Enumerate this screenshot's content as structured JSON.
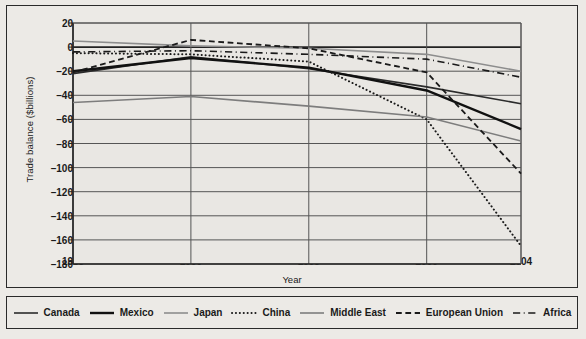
{
  "chart_data": {
    "type": "line",
    "title": "",
    "xlabel": "Year",
    "ylabel": "Trade balance ($billions)",
    "x": [
      1985,
      1990,
      1995,
      2000,
      2004
    ],
    "xticklabels": [
      "1985",
      "1990",
      "1995",
      "2000",
      "2004"
    ],
    "yticklabels": [
      "20",
      "0",
      "-20",
      "-40",
      "-60",
      "-80",
      "-100",
      "-120",
      "-140",
      "-160",
      "-180"
    ],
    "xlim": [
      1985,
      2004
    ],
    "ylim": [
      -180,
      20
    ],
    "ytick_step": 20,
    "grid": "horizontal-and-vertical",
    "legend_position": "below-chart",
    "series": [
      {
        "name": "Canada",
        "style": "solid",
        "color": "#2b2b2b",
        "width": 1.6,
        "values": [
          -22,
          -8,
          -18,
          -33,
          -47
        ]
      },
      {
        "name": "Mexico",
        "style": "solid",
        "color": "#111111",
        "width": 2.4,
        "values": [
          -20,
          -9,
          -17,
          -36,
          -68
        ]
      },
      {
        "name": "Japan",
        "style": "solid",
        "color": "#8d8d8d",
        "width": 1.6,
        "values": [
          5,
          1,
          -1,
          -6,
          -20
        ]
      },
      {
        "name": "China",
        "style": "dotted",
        "color": "#1a1a1a",
        "width": 2.0,
        "values": [
          -5,
          -6,
          -12,
          -60,
          -165
        ]
      },
      {
        "name": "Middle East",
        "style": "solid",
        "color": "#7d7d7d",
        "width": 1.6,
        "values": [
          -46,
          -41,
          -49,
          -58,
          -78
        ]
      },
      {
        "name": "European Union",
        "style": "dashed",
        "color": "#1a1a1a",
        "width": 1.8,
        "values": [
          -21,
          6,
          -1,
          -21,
          -105
        ]
      },
      {
        "name": "Africa",
        "style": "dashdot",
        "color": "#1a1a1a",
        "width": 1.6,
        "values": [
          -4,
          -3,
          -6,
          -10,
          -25
        ]
      }
    ]
  },
  "legend": {
    "items": [
      {
        "label": "Canada"
      },
      {
        "label": "Mexico"
      },
      {
        "label": "Japan"
      },
      {
        "label": "China"
      },
      {
        "label": "Middle East"
      },
      {
        "label": "European Union"
      },
      {
        "label": "Africa"
      }
    ]
  }
}
